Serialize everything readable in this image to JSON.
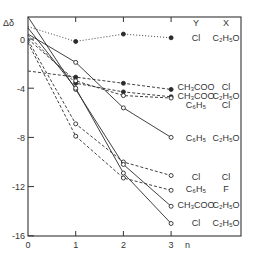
{
  "chart_data": {
    "type": "line",
    "title": "",
    "xlabel": "n",
    "ylabel": "Δδ",
    "x": [
      0,
      1,
      2,
      3
    ],
    "x_ticks": [
      "0",
      "1",
      "2",
      "3"
    ],
    "y_ticks": [
      "0",
      "-4",
      "-8",
      "-12",
      "-16"
    ],
    "xlim": [
      0,
      3.9
    ],
    "ylim": [
      -16,
      1.8
    ],
    "grid": false,
    "legend_headers": {
      "Y": "Y",
      "X": "X"
    },
    "series": [
      {
        "name": "Y=Cl, X=C2H5O (dotted)",
        "Y": "Cl",
        "X": "C₂H₅O",
        "style": "dotted",
        "marker": "filled",
        "values": [
          1.0,
          -0.2,
          0.4,
          0.1
        ]
      },
      {
        "name": "Y=CH3COO, X=Cl",
        "Y": "CH₃COO",
        "X": "Cl",
        "style": "dashed",
        "marker": "filled",
        "values": [
          -2.6,
          -3.1,
          -3.6,
          -4.1
        ]
      },
      {
        "name": "Y=CH3COO, X=C2H5O (dashed)",
        "Y": "CH₃COO",
        "X": "C₂H₅O",
        "style": "dashed",
        "marker": "filled",
        "values": [
          0.3,
          -3.6,
          -4.3,
          -4.7
        ]
      },
      {
        "name": "Y=C6H5, X=Cl",
        "Y": "C₆H₅",
        "X": "Cl",
        "style": "dashed",
        "marker": "open",
        "values": [
          0.0,
          -3.4,
          -4.6,
          -4.8
        ]
      },
      {
        "name": "Y=C6H5, X=C2H5O",
        "Y": "C₆H₅",
        "X": "C₂H₅O",
        "style": "solid",
        "marker": "open",
        "values": [
          0.4,
          -1.9,
          -5.6,
          -8.0
        ]
      },
      {
        "name": "Y=Cl, X=Cl",
        "Y": "Cl",
        "X": "Cl",
        "style": "dashed",
        "marker": "open",
        "values": [
          -0.1,
          -6.9,
          -10.0,
          -11.1
        ]
      },
      {
        "name": "Y=C6H5, X=F",
        "Y": "C₆H₅",
        "X": "F",
        "style": "dashed",
        "marker": "open",
        "values": [
          -0.3,
          -7.9,
          -11.3,
          -12.3
        ]
      },
      {
        "name": "Y=CH3COO, X=C2H5O (solid)",
        "Y": "CH₃COO",
        "X": "C₂H₅O",
        "style": "solid",
        "marker": "open",
        "values": [
          1.8,
          -4.1,
          -10.2,
          -13.6
        ]
      },
      {
        "name": "Y=Cl, X=C2H5O (solid)",
        "Y": "Cl",
        "X": "C₂H₅O",
        "style": "solid",
        "marker": "open",
        "values": [
          0.9,
          -4.0,
          -10.9,
          -15.0
        ]
      }
    ],
    "annotations": [
      {
        "Y": "Cl",
        "X": "C₂H₅O"
      },
      {
        "Y": "CH₃COO",
        "X": "Cl"
      },
      {
        "Y": "CH₃COO",
        "X": "C₂H₅O"
      },
      {
        "Y": "C₆H₅",
        "X": "Cl"
      },
      {
        "Y": "C₆H₅",
        "X": "C₂H₅O"
      },
      {
        "Y": "Cl",
        "X": "Cl"
      },
      {
        "Y": "C₆H₅",
        "X": "F"
      },
      {
        "Y": "CH₃COO",
        "X": "C₂H₅O"
      },
      {
        "Y": "Cl",
        "X": "C₂H₅O"
      }
    ],
    "colors": {
      "line": "#2a2a2a",
      "axis": "#333333",
      "background": "#ffffff"
    }
  }
}
